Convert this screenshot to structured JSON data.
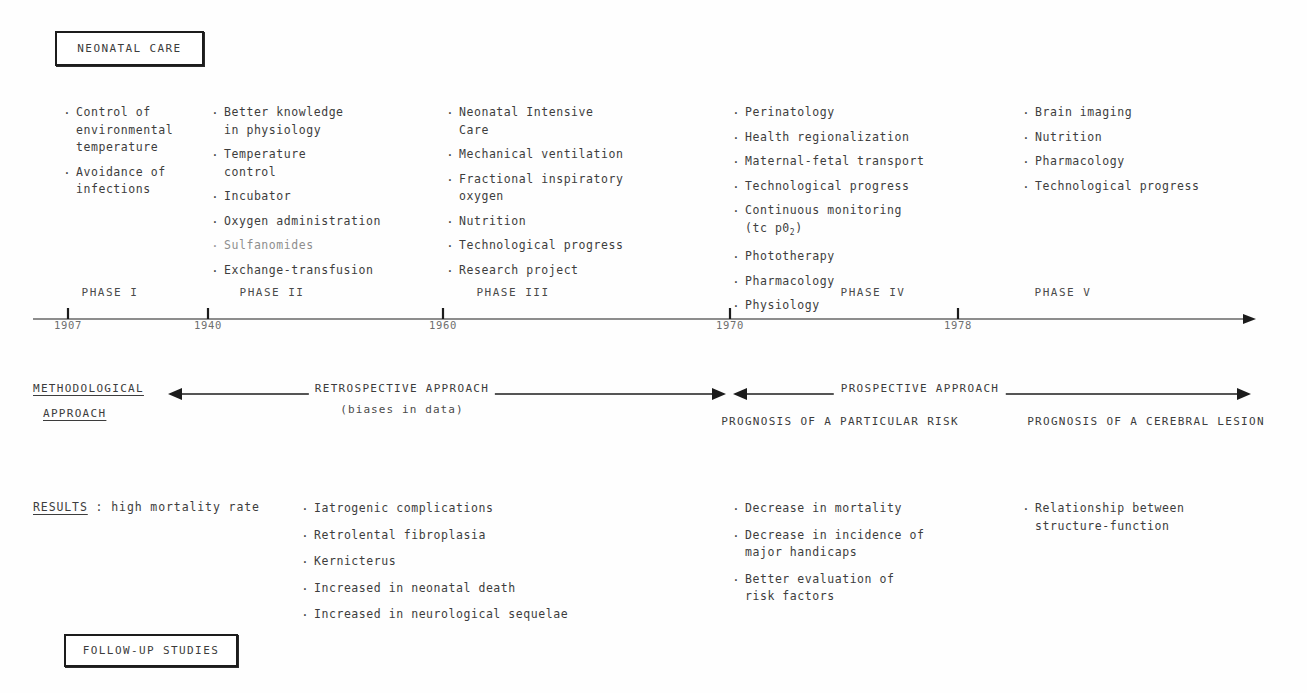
{
  "title_box": {
    "label": "NEONATAL CARE"
  },
  "followup_box": {
    "label": "FOLLOW-UP STUDIES"
  },
  "columns": [
    {
      "id": "phase-i",
      "items": [
        {
          "text": "Control of\nenvironmental\ntemperature"
        },
        {
          "text": "Avoidance of\ninfections"
        }
      ]
    },
    {
      "id": "phase-ii",
      "items": [
        {
          "text": "Better knowledge\nin physiology"
        },
        {
          "text": "Temperature\ncontrol"
        },
        {
          "text": "Incubator"
        },
        {
          "text": "Oxygen administration"
        },
        {
          "text": "Sulfanomides",
          "faint": true
        },
        {
          "text": "Exchange-transfusion"
        }
      ]
    },
    {
      "id": "phase-iii",
      "items": [
        {
          "text": "Neonatal Intensive\nCare"
        },
        {
          "text": "Mechanical ventilation"
        },
        {
          "text": "Fractional inspiratory\noxygen"
        },
        {
          "text": "Nutrition"
        },
        {
          "text": "Technological progress"
        },
        {
          "text": "Research project"
        }
      ]
    },
    {
      "id": "phase-iv",
      "items": [
        {
          "text": "Perinatology"
        },
        {
          "text": "Health regionalization"
        },
        {
          "text": "Maternal-fetal transport"
        },
        {
          "text": "Technological progress"
        },
        {
          "text": "Continuous monitoring\n(tc p0",
          "subscript": "2",
          "after": ")"
        },
        {
          "text": "Phototherapy"
        },
        {
          "text": "Pharmacology"
        },
        {
          "text": "Physiology"
        }
      ]
    },
    {
      "id": "phase-v",
      "items": [
        {
          "text": "Brain imaging"
        },
        {
          "text": "Nutrition"
        },
        {
          "text": "Pharmacology"
        },
        {
          "text": "Technological progress"
        }
      ]
    }
  ],
  "timeline": {
    "axis_start_x": 33,
    "axis_end_x": 1256,
    "axis_y": 33,
    "ticks": [
      {
        "year": "1907",
        "x": 68
      },
      {
        "year": "1940",
        "x": 208
      },
      {
        "year": "1960",
        "x": 443
      },
      {
        "year": "1970",
        "x": 730
      },
      {
        "year": "1978",
        "x": 958
      }
    ],
    "phases": [
      {
        "label": "PHASE I",
        "x": 110
      },
      {
        "label": "PHASE II",
        "x": 272
      },
      {
        "label": "PHASE III",
        "x": 513
      },
      {
        "label": "PHASE IV",
        "x": 873
      },
      {
        "label": "PHASE V",
        "x": 1063
      }
    ]
  },
  "method": {
    "title_line1": "METHODOLOGICAL",
    "title_line2": "APPROACH",
    "retrospective_label": "RETROSPECTIVE APPROACH",
    "retrospective_sub": "(biases in data)",
    "prospective_label": "PROSPECTIVE   APPROACH",
    "prognosis_left": "PROGNOSIS OF A PARTICULAR RISK",
    "prognosis_right": "PROGNOSIS OF A CEREBRAL LESION",
    "arrows": [
      {
        "name": "retrospective-arrow",
        "x1": 168,
        "x2": 726,
        "y": 22
      },
      {
        "name": "prospective-arrow",
        "x1": 733,
        "x2": 1251,
        "y": 22
      }
    ]
  },
  "results": {
    "heading": "RESULTS",
    "heading_rest": " : high mortality rate",
    "columns": [
      {
        "id": "results-early",
        "items": [
          {
            "text": "Iatrogenic complications"
          },
          {
            "text": "Retrolental fibroplasia"
          },
          {
            "text": "Kernicterus"
          },
          {
            "text": "Increased in neonatal death"
          },
          {
            "text": "Increased in neurological sequelae"
          }
        ]
      },
      {
        "id": "results-phase-iv",
        "items": [
          {
            "text": "Decrease in mortality"
          },
          {
            "text": "Decrease in incidence of\nmajor handicaps"
          },
          {
            "text": "Better evaluation of\nrisk factors"
          }
        ]
      },
      {
        "id": "results-phase-v",
        "items": [
          {
            "text": "Relationship between\nstructure-function"
          }
        ]
      }
    ]
  },
  "colors": {
    "ink": "#3d3d3d",
    "line": "#1c1c1c",
    "faint": "#8e8e8e",
    "background": "#fefefe"
  }
}
